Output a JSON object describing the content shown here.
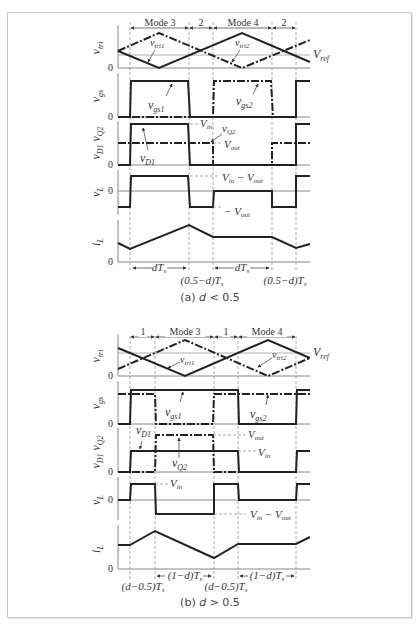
{
  "figure_a": {
    "caption_prefix": "(a)",
    "caption_var": "d",
    "caption_rel": "< 0.5",
    "modes": [
      "Mode 3",
      "2",
      "Mode 4",
      "2"
    ],
    "axis_labels": [
      "v_tri",
      "v_gs",
      "v_D1 v_Q2",
      "v_L",
      "i_L"
    ],
    "zero": "0",
    "annotations": {
      "vtri1": "v_tri1",
      "vtri2": "v_tri2",
      "vref": "V_ref",
      "vgs1": "v_gs1",
      "vgs2": "v_gs2",
      "vin": "V_in",
      "vq2": "v_Q2",
      "vout": "V_out",
      "vd1": "v_D1",
      "vin_minus_vout": "V_in − V_out",
      "neg_vout": "− V_out"
    },
    "intervals": [
      "dT_s",
      "(0.5−d)T_s",
      "dT_s",
      "(0.5−d)T_s"
    ]
  },
  "figure_b": {
    "caption_prefix": "(b)",
    "caption_var": "d",
    "caption_rel": "> 0.5",
    "modes": [
      "1",
      "Mode 3",
      "1",
      "Mode 4"
    ],
    "axis_labels": [
      "v_tri",
      "v_gs",
      "v_D1 v_Q2",
      "v_L",
      "i_L"
    ],
    "zero": "0",
    "annotations": {
      "vtri1": "v_tri1",
      "vtri2": "v_tri2",
      "vref": "V_ref",
      "vgs1": "v_gs1",
      "vgs2": "v_gs2",
      "vd1": "v_D1",
      "vout": "V_out",
      "vin": "V_in",
      "vq2": "v_Q2",
      "vin_l": "V_in",
      "vin_minus_vout": "V_in − V_out"
    },
    "intervals": [
      "(d−0.5)T_s",
      "(1−d)T_s",
      "(d−0.5)T_s",
      "(1−d)T_s"
    ]
  }
}
